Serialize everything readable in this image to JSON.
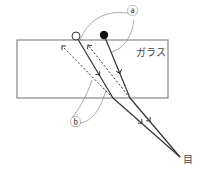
{
  "diagram": {
    "type": "optics-refraction",
    "labels": {
      "glass": "ガラス",
      "eye": "目",
      "marker_a": "ⓐ",
      "marker_b": "ⓑ"
    },
    "objects": {
      "open_circle": {
        "x": 76,
        "y": 36
      },
      "filled_circle": {
        "x": 104,
        "y": 35
      }
    },
    "glass_rect": {
      "x": 17,
      "y": 40,
      "width": 151,
      "height": 58
    },
    "eye_point": {
      "x": 180,
      "y": 157
    },
    "colors": {
      "line": "#333333",
      "thin": "#777777",
      "glass_border": "#888888"
    }
  }
}
